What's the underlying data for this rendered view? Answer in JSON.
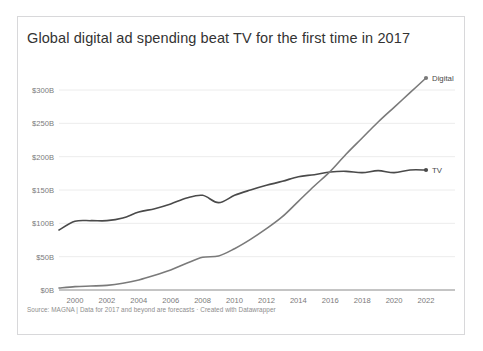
{
  "chart_data": {
    "type": "line",
    "title": "Global digital ad spending beat TV for the first time in 2017",
    "source_note": "Source: MAGNA | Data for 2017 and beyond are forecasts · Created with Datawrapper",
    "xlabel": "",
    "ylabel": "",
    "xlim": [
      1999,
      2022
    ],
    "ylim": [
      0,
      300
    ],
    "grid": true,
    "legend_position": "right-end-labels",
    "y_ticks": [
      "$0B",
      "$50B",
      "$100B",
      "$150B",
      "$200B",
      "$250B",
      "$300B"
    ],
    "y_tick_values": [
      0,
      50,
      100,
      150,
      200,
      250,
      300
    ],
    "x_ticks": [
      "2000",
      "2002",
      "2004",
      "2006",
      "2008",
      "2010",
      "2012",
      "2014",
      "2016",
      "2018",
      "2020",
      "2022"
    ],
    "x_tick_values": [
      2000,
      2002,
      2004,
      2006,
      2008,
      2010,
      2012,
      2014,
      2016,
      2018,
      2020,
      2022
    ],
    "x": [
      1999,
      2000,
      2001,
      2002,
      2003,
      2004,
      2005,
      2006,
      2007,
      2008,
      2009,
      2010,
      2011,
      2012,
      2013,
      2014,
      2015,
      2016,
      2017,
      2018,
      2019,
      2020,
      2021,
      2022
    ],
    "series": [
      {
        "name": "TV",
        "color": "#4a4a4a",
        "end_label": "TV",
        "values": [
          90,
          103,
          104,
          104,
          108,
          117,
          122,
          129,
          138,
          142,
          131,
          142,
          150,
          157,
          163,
          170,
          173,
          177,
          178,
          176,
          179,
          176,
          180,
          180
        ]
      },
      {
        "name": "Digital",
        "color": "#7a7a7a",
        "end_label": "Digital",
        "values": [
          3,
          5,
          6,
          7,
          10,
          15,
          22,
          30,
          40,
          49,
          51,
          62,
          76,
          92,
          110,
          133,
          156,
          178,
          204,
          228,
          252,
          274,
          296,
          318
        ]
      }
    ]
  },
  "footer": {
    "text": "Source: MAGNA | Data for 2017 and beyond are forecasts · Created with Datawrapper"
  }
}
